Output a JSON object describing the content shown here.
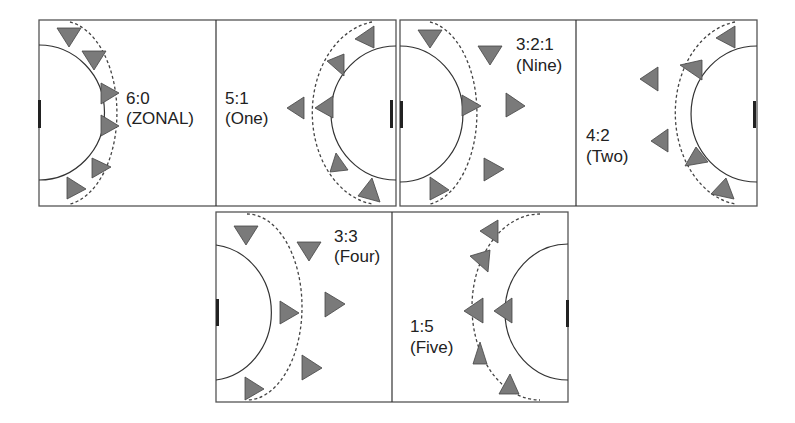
{
  "diagram": {
    "colors": {
      "court_line": "#555555",
      "player": "#7a7a7a",
      "goal": "#222222"
    },
    "formations": [
      {
        "id": "6-0",
        "label_line1": "6:0",
        "label_line2": "(ZONAL)",
        "side": "left"
      },
      {
        "id": "5-1",
        "label_line1": "5:1",
        "label_line2": "(One)",
        "side": "right"
      },
      {
        "id": "3-2-1",
        "label_line1": "3:2:1",
        "label_line2": "(Nine)",
        "side": "left"
      },
      {
        "id": "4-2",
        "label_line1": "4:2",
        "label_line2": "(Two)",
        "side": "right"
      },
      {
        "id": "3-3",
        "label_line1": "3:3",
        "label_line2": "(Four)",
        "side": "left"
      },
      {
        "id": "1-5",
        "label_line1": "1:5",
        "label_line2": "(Five)",
        "side": "right"
      }
    ]
  }
}
